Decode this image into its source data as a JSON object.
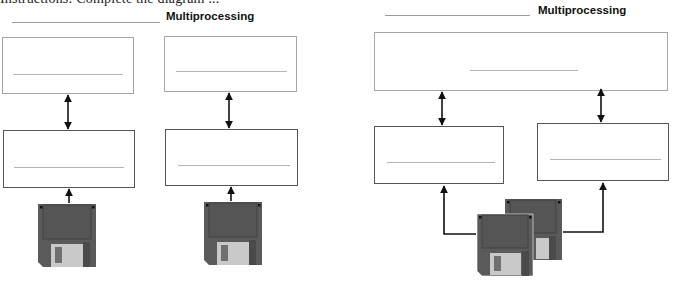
{
  "header_fragment": "Instructions: Complete the diagram ...",
  "left_diagram": {
    "title": "Multiprocessing",
    "title_blank": "",
    "top_boxes": [
      {
        "label": "",
        "blank": ""
      },
      {
        "label": "",
        "blank": ""
      }
    ],
    "bottom_boxes": [
      {
        "label": "",
        "blank": ""
      },
      {
        "label": "",
        "blank": ""
      }
    ],
    "connectors": [
      "bidirectional",
      "bidirectional",
      "upward",
      "upward"
    ],
    "storage": [
      {
        "icon": "floppy-disk-icon"
      },
      {
        "icon": "floppy-disk-icon"
      }
    ]
  },
  "right_diagram": {
    "title": "Multiprocessing",
    "title_blank": "",
    "top_box": {
      "label": "",
      "blank": ""
    },
    "bottom_boxes": [
      {
        "label": "",
        "blank": ""
      },
      {
        "label": "",
        "blank": ""
      }
    ],
    "connectors": [
      "bidirectional",
      "bidirectional",
      "elbow-upward",
      "elbow-upward"
    ],
    "storage": {
      "icon": "floppy-disks-stack-icon",
      "count": 2
    }
  },
  "colors": {
    "disk_body": "#5a5a5a",
    "disk_shutter": "#c9c9c9",
    "disk_window": "#707070",
    "box_border_light": "#a6a6a6",
    "box_border_dark": "#555555",
    "arrow": "#111111"
  }
}
